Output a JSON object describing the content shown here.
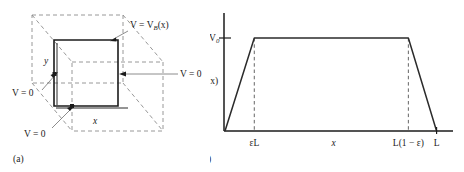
{
  "figure": {
    "panel_a": {
      "caption": "(a)",
      "labels": {
        "top_potential": "V = V",
        "top_potential_sub": "B",
        "top_potential_tail": "(x)",
        "right_zero": "V = 0",
        "left_zero": "V = 0",
        "bottom_zero": "V = 0",
        "axis_x": "x",
        "axis_y": "y"
      }
    },
    "panel_b": {
      "caption": "(b)",
      "labels": {
        "y_top": "V",
        "y_top_sub": "0",
        "y_axis": "V",
        "y_axis_sub": "B",
        "y_axis_tail": "(x)",
        "x_tick_1": "εL",
        "x_axis": "x",
        "x_tick_2": "L(1 − ε)",
        "x_tick_3": "L"
      }
    }
  },
  "chart_data": {
    "type": "line",
    "title": "",
    "xlabel": "x",
    "ylabel": "V_B(x)",
    "xlim": [
      0,
      1.0
    ],
    "ylim": [
      0,
      1.15
    ],
    "grid": false,
    "legend": "none",
    "xtick_labels": [
      "εL",
      "x",
      "L(1 − ε)",
      "L"
    ],
    "xtick_values": [
      0.135,
      0.5,
      0.845,
      0.975
    ],
    "ytick_labels": [
      "V₀"
    ],
    "ytick_values": [
      1.0
    ],
    "series": [
      {
        "name": "V_B(x)",
        "x": [
          0.0,
          0.135,
          0.845,
          0.975
        ],
        "y": [
          0.0,
          1.0,
          1.0,
          0.0
        ],
        "description": "trapezoidal boundary potential: linear ramp up from 0 to V0 over 0 to εL, flat at V0 until L(1-ε), linear ramp down to 0 at L"
      }
    ],
    "annotations": [
      {
        "text": "εL",
        "type": "dashed-vertical",
        "x": 0.135,
        "y_from": 0,
        "y_to": 1.0
      },
      {
        "text": "L(1 − ε)",
        "type": "dashed-vertical",
        "x": 0.845,
        "y_from": 0,
        "y_to": 1.0
      },
      {
        "text": "V₀",
        "type": "tick-mark",
        "axis": "y",
        "value": 1.0
      }
    ],
    "colors": {
      "curve": "#2b2b2b",
      "axis": "#1b1b1b",
      "dashed": "#555555"
    }
  }
}
